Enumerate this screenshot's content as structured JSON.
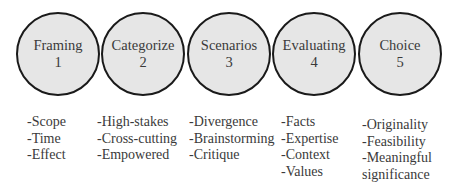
{
  "steps": [
    {
      "title": "Framing",
      "number": "1",
      "items": [
        "-Scope",
        "-Time",
        "-Effect"
      ]
    },
    {
      "title": "Categorize",
      "number": "2",
      "items": [
        "-High-stakes",
        "-Cross-cutting",
        "-Empowered"
      ]
    },
    {
      "title": "Scenarios",
      "number": "3",
      "items": [
        "-Divergence",
        "-Brainstorming",
        "-Critique"
      ]
    },
    {
      "title": "Evaluating",
      "number": "4",
      "items": [
        "-Facts",
        "-Expertise",
        "-Context",
        "-Values"
      ]
    },
    {
      "title": "Choice",
      "number": "5",
      "items": [
        "-Originality",
        "-Feasibility",
        "-Meaningful",
        "significance"
      ]
    }
  ],
  "colors": {
    "circle_fill": "#e6e6e6",
    "circle_border": "#1a1a1a",
    "text": "#3a3a3a"
  }
}
